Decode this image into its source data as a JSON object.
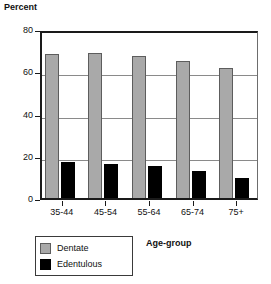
{
  "chart_data": {
    "type": "bar",
    "title": "",
    "ylabel": "Percent",
    "xlabel": "Age-group",
    "categories": [
      "35-44",
      "45-54",
      "55-64",
      "65-74",
      "75+"
    ],
    "series": [
      {
        "name": "Dentate",
        "color": "#a9a9a9",
        "values": [
          68,
          68.5,
          67,
          65,
          61.5
        ]
      },
      {
        "name": "Edentulous",
        "color": "#000000",
        "values": [
          17,
          16,
          15,
          13,
          9.5
        ]
      }
    ],
    "ylim": [
      0,
      80
    ],
    "yticks": [
      0,
      20,
      40,
      60,
      80
    ],
    "ytick_labels": [
      "0",
      "20",
      "40",
      "60",
      "80"
    ],
    "grid": true,
    "legend_position": "bottom-left",
    "legend_entries": [
      "Dentate",
      "Edentulous"
    ]
  },
  "axes": {
    "y_title": "Percent",
    "x_title": "Age-group"
  }
}
